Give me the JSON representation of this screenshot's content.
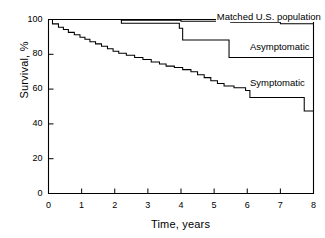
{
  "chart_data": {
    "type": "line",
    "subtype": "kaplan-meier-step",
    "title": "",
    "xlabel": "Time, years",
    "ylabel": "Survival, %",
    "xlim": [
      0,
      8
    ],
    "ylim": [
      0,
      100
    ],
    "xticks": [
      0,
      1,
      2,
      3,
      4,
      5,
      6,
      7,
      8
    ],
    "yticks": [
      0,
      20,
      40,
      60,
      80,
      100
    ],
    "grid": false,
    "legend_position": "inline-right-of-curves",
    "series": [
      {
        "name": "Matched U.S. population",
        "label_x": 5.05,
        "label_y": 101.5,
        "points": [
          [
            0,
            100
          ],
          [
            2.2,
            100
          ],
          [
            2.2,
            99.6
          ],
          [
            4.0,
            99.6
          ],
          [
            4.0,
            99.0
          ],
          [
            5.5,
            99.0
          ],
          [
            5.5,
            98.4
          ],
          [
            7.0,
            98.4
          ],
          [
            7.0,
            97.6
          ],
          [
            8.0,
            97.6
          ],
          [
            8.0,
            96.2
          ]
        ]
      },
      {
        "name": "Asymptomatic",
        "label_x": 6.05,
        "label_y": 84.0,
        "points": [
          [
            0,
            100
          ],
          [
            2.2,
            100
          ],
          [
            2.2,
            97.8
          ],
          [
            3.95,
            97.8
          ],
          [
            3.95,
            95.0
          ],
          [
            4.05,
            95.0
          ],
          [
            4.05,
            88.2
          ],
          [
            5.45,
            88.2
          ],
          [
            5.45,
            78.2
          ],
          [
            8.0,
            78.2
          ]
        ]
      },
      {
        "name": "Symptomatic",
        "label_x": 6.05,
        "label_y": 63.5,
        "points": [
          [
            0,
            100
          ],
          [
            0.12,
            100
          ],
          [
            0.12,
            97.5
          ],
          [
            0.3,
            97.5
          ],
          [
            0.3,
            95.6
          ],
          [
            0.45,
            95.6
          ],
          [
            0.45,
            94.2
          ],
          [
            0.6,
            94.2
          ],
          [
            0.6,
            92.6
          ],
          [
            0.78,
            92.6
          ],
          [
            0.78,
            91.2
          ],
          [
            0.95,
            91.2
          ],
          [
            0.95,
            89.8
          ],
          [
            1.1,
            89.8
          ],
          [
            1.1,
            88.6
          ],
          [
            1.25,
            88.6
          ],
          [
            1.25,
            87.2
          ],
          [
            1.42,
            87.2
          ],
          [
            1.42,
            86.0
          ],
          [
            1.6,
            86.0
          ],
          [
            1.6,
            84.6
          ],
          [
            1.78,
            84.6
          ],
          [
            1.78,
            83.2
          ],
          [
            1.95,
            83.2
          ],
          [
            1.95,
            81.8
          ],
          [
            2.12,
            81.8
          ],
          [
            2.12,
            80.6
          ],
          [
            2.35,
            80.6
          ],
          [
            2.35,
            79.4
          ],
          [
            2.6,
            79.4
          ],
          [
            2.6,
            78.2
          ],
          [
            2.85,
            78.2
          ],
          [
            2.85,
            77.0
          ],
          [
            3.1,
            77.0
          ],
          [
            3.1,
            75.6
          ],
          [
            3.35,
            75.6
          ],
          [
            3.35,
            74.4
          ],
          [
            3.55,
            74.4
          ],
          [
            3.55,
            73.2
          ],
          [
            3.8,
            73.2
          ],
          [
            3.8,
            72.4
          ],
          [
            4.05,
            72.4
          ],
          [
            4.05,
            71.2
          ],
          [
            4.3,
            71.2
          ],
          [
            4.3,
            70.0
          ],
          [
            4.5,
            70.0
          ],
          [
            4.5,
            68.2
          ],
          [
            4.7,
            68.2
          ],
          [
            4.7,
            66.6
          ],
          [
            4.9,
            66.6
          ],
          [
            4.9,
            64.8
          ],
          [
            5.1,
            64.8
          ],
          [
            5.1,
            63.2
          ],
          [
            5.3,
            63.2
          ],
          [
            5.3,
            61.8
          ],
          [
            5.6,
            61.8
          ],
          [
            5.6,
            60.8
          ],
          [
            5.95,
            60.8
          ],
          [
            5.95,
            59.2
          ],
          [
            6.08,
            59.2
          ],
          [
            6.08,
            55.2
          ],
          [
            7.72,
            55.2
          ],
          [
            7.72,
            47.4
          ],
          [
            8.0,
            47.4
          ]
        ]
      }
    ]
  },
  "axes": {
    "y_tick_labels": [
      "0",
      "20",
      "40",
      "60",
      "80",
      "100"
    ],
    "x_tick_labels": [
      "0",
      "1",
      "2",
      "3",
      "4",
      "5",
      "6",
      "7",
      "8"
    ]
  },
  "style": {
    "line_color": "#000000",
    "axis_color": "#000000",
    "background": "#ffffff"
  }
}
